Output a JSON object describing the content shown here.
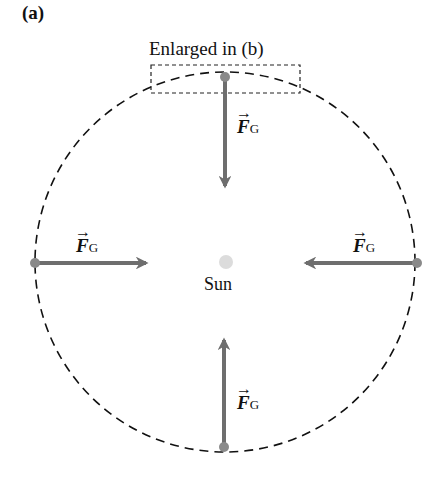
{
  "figure": {
    "panel_label": "(a)",
    "inset_label": "Enlarged in (b)",
    "center_label": "Sun",
    "force_symbol": "F",
    "force_subscript": "G",
    "vector_arrow": "→",
    "forces": [
      {
        "position": "top",
        "direction": "down"
      },
      {
        "position": "left",
        "direction": "right"
      },
      {
        "position": "right",
        "direction": "left"
      },
      {
        "position": "bottom",
        "direction": "up"
      }
    ]
  },
  "colors": {
    "arrow": "#6e6e6e",
    "dot": "#8a8a8a",
    "sun": "#d8d8d8",
    "orbit": "#111111"
  }
}
